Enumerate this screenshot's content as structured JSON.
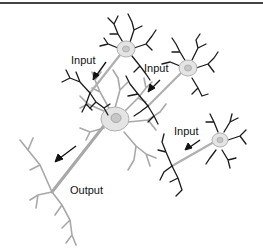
{
  "labels": {
    "input_1": "Input",
    "input_2": "Input",
    "input_3": "Input",
    "output": "Output"
  },
  "colors": {
    "input_neuron_stroke": "#1a1a1a",
    "output_neuron_stroke": "#a8a8a8",
    "soma_fill": "#e4e4e4",
    "nucleus_fill": "#c8c8c8",
    "arrow": "#111111",
    "top_rule": "#444444"
  }
}
